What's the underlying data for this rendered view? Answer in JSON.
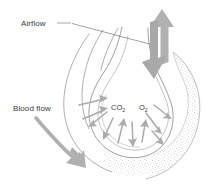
{
  "diagram": {
    "labels": {
      "airflow": "Airflow",
      "blood_flow": "Blood flow"
    },
    "gases": {
      "carbon_dioxide": "CO",
      "carbon_dioxide_sub": "2",
      "oxygen": "O",
      "oxygen_sub": "2"
    },
    "icons": {
      "airflow_arrow": "double-headed-vertical-arrow-icon",
      "blood_flow_arrow": "curved-down-right-arrow-icon",
      "diffusion_arrows": "radiating-diffusion-arrows-icon",
      "alveolus": "alveolar-sac-shape",
      "bronchiole": "bronchiole-airway-shape",
      "capillary": "stippled-capillary-shape"
    },
    "colors": {
      "outline": "#9a9a9a",
      "arrow_gray": "#a8a8a8",
      "arrow_dark_gray": "#999999",
      "leader_line": "#6e6e6e",
      "text": "#3c3c3c",
      "stipple": "#b4b4b4",
      "background": "#ffffff"
    }
  }
}
